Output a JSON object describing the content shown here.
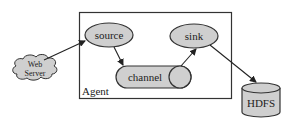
{
  "diagram": {
    "nodes": {
      "web_server": {
        "label_line1": "Web",
        "label_line2": "Server",
        "shape": "cloud"
      },
      "agent": {
        "label": "Agent",
        "shape": "rectangle"
      },
      "source": {
        "label": "source",
        "shape": "ellipse"
      },
      "channel": {
        "label": "channel",
        "shape": "pill"
      },
      "sink": {
        "label": "sink",
        "shape": "ellipse"
      },
      "hdfs": {
        "label": "HDFS",
        "shape": "cylinder"
      }
    },
    "edges": [
      {
        "from": "web_server",
        "to": "source"
      },
      {
        "from": "source",
        "to": "channel"
      },
      {
        "from": "channel",
        "to": "sink"
      },
      {
        "from": "sink",
        "to": "hdfs"
      }
    ],
    "colors": {
      "node_fill": "#cfcfcf",
      "stroke": "#333333",
      "background": "#ffffff"
    }
  }
}
